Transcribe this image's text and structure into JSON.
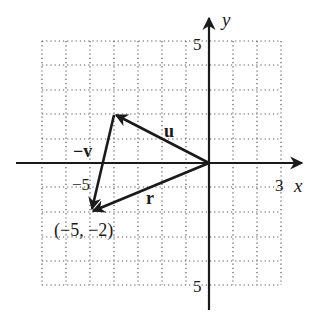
{
  "diagram": {
    "type": "vector-diagram",
    "axes": {
      "x_label": "x",
      "y_label": "y",
      "x_tick_label": "3",
      "x_neg_tick_label": "−5",
      "y_top_tick_label": "5",
      "y_bottom_tick_label": "5"
    },
    "grid": {
      "x_range": [
        -7,
        3
      ],
      "y_range": [
        -5,
        5
      ],
      "step": 1
    },
    "vectors": [
      {
        "name": "u",
        "label": "u",
        "from": [
          0,
          0
        ],
        "to": [
          -4,
          2
        ]
      },
      {
        "name": "neg-v",
        "label": "−v",
        "from": [
          -4,
          2
        ],
        "to": [
          -5,
          -2
        ]
      },
      {
        "name": "r",
        "label": "r",
        "from": [
          0,
          0
        ],
        "to": [
          -5,
          -2
        ]
      }
    ],
    "point_label": "(−5, −2)",
    "colors": {
      "ink": "#1a1a1a",
      "grid": "#555555",
      "background": "#ffffff"
    }
  }
}
